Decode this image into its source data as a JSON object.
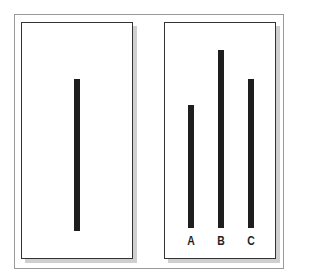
{
  "figure": {
    "title": "",
    "reference_card": {
      "line": {
        "length_px": 152
      }
    },
    "comparison_card": {
      "lines": [
        {
          "label": "A",
          "length_px": 123
        },
        {
          "label": "B",
          "length_px": 178
        },
        {
          "label": "C",
          "length_px": 149
        }
      ]
    },
    "colors": {
      "line": "#1e1e1e",
      "card_border": "#333333",
      "outer_border": "#9a9a9a",
      "shadow": "#cfcfcf"
    }
  }
}
